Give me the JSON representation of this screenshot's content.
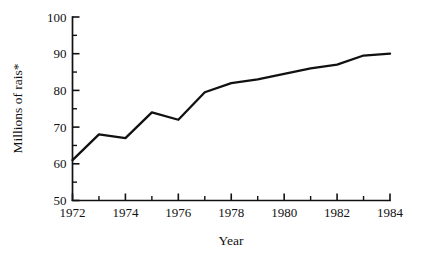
{
  "chart_data": {
    "type": "line",
    "title": "",
    "subtitle": "",
    "xlabel": "Year",
    "ylabel": "Millions of rais*",
    "x": [
      1972,
      1973,
      1974,
      1975,
      1976,
      1977,
      1978,
      1979,
      1980,
      1981,
      1982,
      1983,
      1984
    ],
    "series": [
      {
        "name": "",
        "values": [
          61,
          68,
          67,
          74,
          72,
          79.5,
          82,
          83,
          84.5,
          86,
          87,
          89.5,
          90
        ],
        "color": "#111111"
      }
    ],
    "xlim": [
      1972,
      1984
    ],
    "ylim": [
      50,
      100
    ],
    "x_tick_labels": [
      "1972",
      "1974",
      "1976",
      "1978",
      "1980",
      "1982",
      "1984"
    ],
    "x_tick_values": [
      1972,
      1974,
      1976,
      1978,
      1980,
      1982,
      1984
    ],
    "x_minor_tick_values": [
      1973,
      1975,
      1977,
      1979,
      1981,
      1983
    ],
    "y_tick_labels": [
      "50",
      "60",
      "70",
      "80",
      "90",
      "100"
    ],
    "y_tick_values": [
      50,
      60,
      70,
      80,
      90,
      100
    ],
    "y_minor_tick_values": [
      55,
      65,
      75,
      85,
      95
    ],
    "grid": false,
    "legend": false,
    "legend_position": "none",
    "annotations": [],
    "footnote_marker": "*"
  },
  "axes": {
    "x_title": "Year",
    "y_title": "Millions of rais*"
  },
  "style": {
    "line_color": "#111111",
    "axis_color": "#111111",
    "background": "#ffffff",
    "text_color": "#111111"
  }
}
